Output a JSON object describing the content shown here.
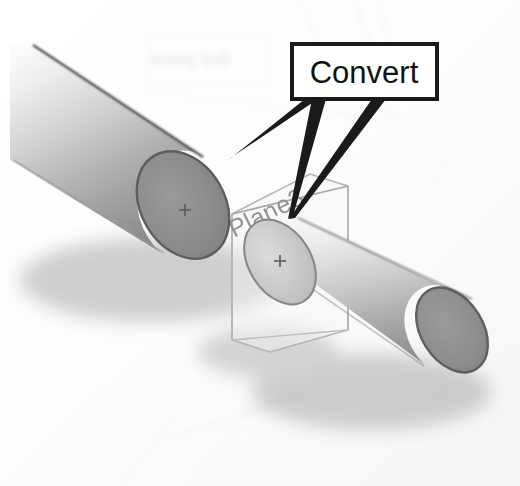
{
  "figure": {
    "name": "solidworks-convert-entities-callout",
    "caption_visible": false,
    "background_color": "#fdfdfd",
    "width": 520,
    "height": 486
  },
  "callout": {
    "label": "Convert",
    "box": {
      "x": 292,
      "y": 44,
      "width": 145,
      "height": 55
    },
    "border_color": "#1a1a1a",
    "fill_color": "#ffffff",
    "text_color": "#121212",
    "border_width": 4,
    "leaders": [
      {
        "name": "leader-to-upper-cylinder-face",
        "tip_x": 226,
        "tip_y": 160,
        "target": "upper-cylinder-end-cap"
      },
      {
        "name": "leader-to-lower-cylinder-face",
        "tip_x": 290,
        "tip_y": 218,
        "target": "lower-cylinder-end-cap"
      }
    ]
  },
  "scene": {
    "plane": {
      "label": "Plane3",
      "label_color": "#8e8e8e",
      "label_rotation_deg": -26,
      "outline_color": "#b0b0b0",
      "fill_color": "rgba(245,245,245,0.35)"
    },
    "cylinders": [
      {
        "name": "upper-left-cylinder",
        "body_light": "#f2f2f2",
        "body_dark": "#8d8d8d",
        "cap_color": "#8b8b8b",
        "cap_edge_color": "#5d5d5d",
        "center_mark": "+"
      },
      {
        "name": "lower-right-cylinder",
        "body_light": "#f0f0f0",
        "body_dark": "#909090",
        "cap_color": "#8e8e8e",
        "cap_edge_color": "#5f5f5f",
        "center_mark": "+"
      }
    ],
    "shadow_color": "rgba(90,90,90,0.35)"
  },
  "show_through": {
    "note": "faint mirrored text bleeding from reverse side of the scanned page",
    "text": "3rd point",
    "color": "#e4e4e4"
  }
}
